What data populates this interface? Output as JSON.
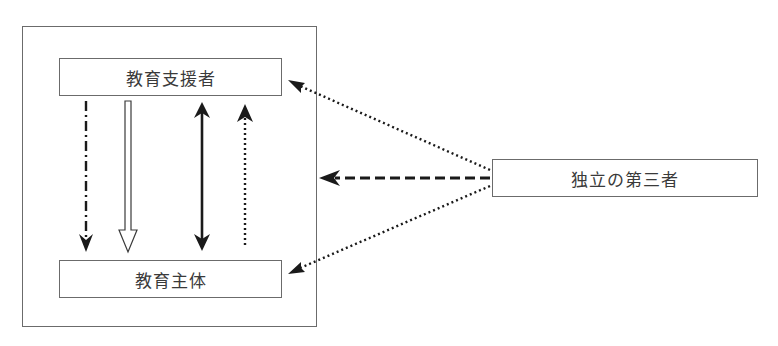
{
  "diagram": {
    "nodes": {
      "supporter": {
        "label": "教育支援者"
      },
      "subject": {
        "label": "教育主体"
      },
      "third_party": {
        "label": "独立の第三者"
      }
    },
    "container": {
      "contains": [
        "supporter",
        "subject"
      ]
    },
    "edges": [
      {
        "from": "supporter",
        "to": "subject",
        "style": "dash-dot",
        "arrow": "single"
      },
      {
        "from": "supporter",
        "to": "subject",
        "style": "hollow",
        "arrow": "single"
      },
      {
        "from": "supporter",
        "to": "subject",
        "style": "solid-bold",
        "arrow": "double"
      },
      {
        "from": "subject",
        "to": "supporter",
        "style": "dotted",
        "arrow": "single"
      },
      {
        "from": "third_party",
        "to": "supporter",
        "style": "dotted",
        "arrow": "single"
      },
      {
        "from": "third_party",
        "to": "container",
        "style": "dashed",
        "arrow": "single"
      },
      {
        "from": "third_party",
        "to": "subject",
        "style": "dotted",
        "arrow": "single"
      }
    ],
    "colors": {
      "line": "#1a1a1a",
      "border": "#6b6b6b",
      "text": "#3a3a3a"
    }
  }
}
